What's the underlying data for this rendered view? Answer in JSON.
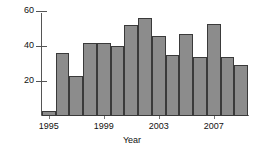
{
  "chart_data": {
    "type": "bar",
    "title": "",
    "subtitle": "",
    "xlabel": "Year",
    "ylabel": "",
    "categories": [
      "1995",
      "1996",
      "1997",
      "1998",
      "1999",
      "2000",
      "2001",
      "2002",
      "2003",
      "2004",
      "2005",
      "2006",
      "2007",
      "2008",
      "2009"
    ],
    "values": [
      3,
      36,
      23,
      42,
      42,
      40,
      52,
      56,
      46,
      35,
      47,
      34,
      53,
      34,
      29
    ],
    "series": [
      {
        "name": "count",
        "values": [
          3,
          36,
          23,
          42,
          42,
          40,
          52,
          56,
          46,
          35,
          47,
          34,
          53,
          34,
          29
        ]
      }
    ],
    "xlim": [
      1994.5,
      2009.5
    ],
    "ylim": [
      0,
      62
    ],
    "y_ticks": [
      20,
      40,
      60
    ],
    "y_tick_labels": [
      "20",
      "40",
      "60"
    ],
    "x_ticks": [
      1995,
      1999,
      2003,
      2007
    ],
    "x_tick_labels": [
      "1995",
      "1999",
      "2003",
      "2007"
    ],
    "grid": false,
    "legend": false,
    "legend_position": "none",
    "bar_fill_color": "#8c8c8c",
    "bar_edge_color": "#3a3a3a",
    "axis_color": "#555555",
    "text_color": "#111111",
    "background_color": "#ffffff"
  }
}
